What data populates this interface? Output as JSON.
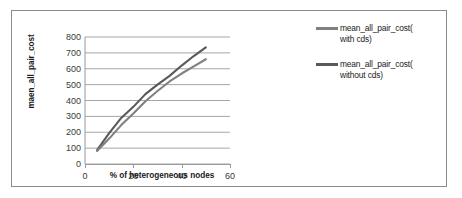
{
  "chart_data": {
    "type": "line",
    "title": "",
    "xlabel": "% of heterogeneous nodes",
    "ylabel": "maen_all_pair_cost",
    "xlim": [
      0,
      60
    ],
    "ylim": [
      0,
      800
    ],
    "xticks": [
      "0",
      "20",
      "40",
      "60"
    ],
    "xtick_values": [
      0,
      20,
      40,
      60
    ],
    "yticks": [
      "0",
      "100",
      "200",
      "300",
      "400",
      "500",
      "600",
      "700",
      "800"
    ],
    "ytick_values": [
      0,
      100,
      200,
      300,
      400,
      500,
      600,
      700,
      800
    ],
    "grid": "horizontal",
    "legend_position": "right",
    "x": [
      5,
      10,
      15,
      20,
      25,
      30,
      35,
      40,
      45,
      50
    ],
    "series": [
      {
        "name": "mean_all_pair_cost( without cds)",
        "color": "#595959",
        "values": [
          88,
          195,
          290,
          360,
          440,
          500,
          555,
          620,
          680,
          735
        ]
      },
      {
        "name": "mean_all_pair_cost( with cds)",
        "color": "#808080",
        "values": [
          82,
          160,
          245,
          318,
          395,
          460,
          520,
          570,
          615,
          660
        ]
      }
    ]
  },
  "legend": {
    "entries": [
      {
        "label": "mean_all_pair_cost(\nwith cds)",
        "color": "#808080"
      },
      {
        "label": "mean_all_pair_cost(\nwithout cds)",
        "color": "#595959"
      }
    ]
  },
  "colors": {
    "frame_border": "#8c8c8c",
    "gridline": "#a6a6a6",
    "axis": "#9a9a9a",
    "tick_text": "#3a3a3a",
    "axis_title": "#1a1a1a",
    "background": "#ffffff"
  }
}
